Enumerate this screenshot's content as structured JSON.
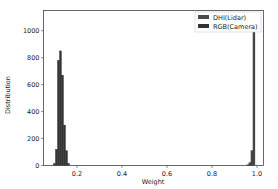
{
  "chart_data": {
    "type": "bar",
    "title": "",
    "xlabel": "Weight",
    "ylabel": "Distribution",
    "xlim": [
      0.05,
      1.02
    ],
    "ylim": [
      0,
      1150
    ],
    "xticks": [
      0.2,
      0.4,
      0.6,
      0.8,
      1.0
    ],
    "xtick_labels": [
      "0.2",
      "0.4",
      "0.6",
      "0.8",
      "1.0"
    ],
    "yticks": [
      0,
      200,
      400,
      600,
      800,
      1000
    ],
    "ytick_labels": [
      "0",
      "200",
      "400",
      "600",
      "800",
      "1000"
    ],
    "grid": false,
    "legend_position": "upper right",
    "bin_width": 0.009,
    "series": [
      {
        "name": "DHI(Lidar)",
        "color": "#4a4a4a",
        "bins": [
          0.955,
          0.964,
          0.973,
          0.982
        ],
        "values": [
          5,
          20,
          110,
          1000
        ]
      },
      {
        "name": "RGB(Camera)",
        "color": "#333333",
        "bins": [
          0.095,
          0.104,
          0.113,
          0.122,
          0.131,
          0.14,
          0.149,
          0.158
        ],
        "values": [
          15,
          120,
          780,
          850,
          670,
          300,
          110,
          15
        ]
      }
    ]
  }
}
